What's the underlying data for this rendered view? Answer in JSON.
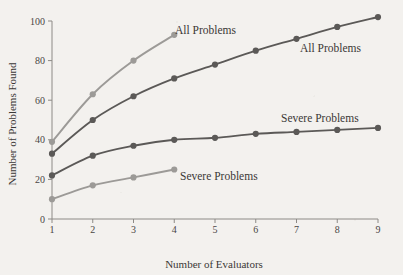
{
  "chart_data": {
    "type": "line",
    "title": "",
    "xlabel": "Number of Evaluators",
    "ylabel": "Number of Problems Found",
    "xlim": [
      1,
      9
    ],
    "ylim": [
      0,
      100
    ],
    "xticks": [
      "1",
      "2",
      "3",
      "4",
      "5",
      "6",
      "7",
      "8",
      "9"
    ],
    "yticks": [
      "0",
      "20",
      "40",
      "60",
      "80",
      "100"
    ],
    "grid": false,
    "legend_position": "inline-annotations",
    "x": [
      1,
      2,
      3,
      4,
      5,
      6,
      7,
      8,
      9
    ],
    "series": [
      {
        "name": "All Problems",
        "label": "All Problems",
        "color": "#9c9a97",
        "x": [
          1,
          2,
          3,
          4
        ],
        "values": [
          39,
          63,
          80,
          93
        ]
      },
      {
        "name": "All Problems",
        "label": "All Problems",
        "color": "#5b5957",
        "x": [
          1,
          2,
          3,
          4,
          5,
          6,
          7,
          8,
          9
        ],
        "values": [
          33,
          50,
          62,
          71,
          78,
          85,
          91,
          97,
          102
        ]
      },
      {
        "name": "Severe Problems",
        "label": "Severe Problems",
        "color": "#5b5957",
        "x": [
          1,
          2,
          3,
          4,
          5,
          6,
          7,
          8,
          9
        ],
        "values": [
          22,
          32,
          37,
          40,
          41,
          43,
          44,
          45,
          46
        ]
      },
      {
        "name": "Severe Problems",
        "label": "Severe Problems",
        "color": "#9c9a97",
        "x": [
          1,
          2,
          3,
          4
        ],
        "values": [
          10,
          17,
          21,
          25
        ]
      }
    ],
    "annotations": [
      {
        "text": "All Problems",
        "anchor_x": 4,
        "anchor_y": 93,
        "px": 175,
        "py": 34,
        "color": "#3b3836"
      },
      {
        "text": "All Problems",
        "anchor_x": 8,
        "anchor_y": 97,
        "px": 300,
        "py": 52,
        "color": "#3b3836"
      },
      {
        "text": "Severe Problems",
        "anchor_x": 8,
        "anchor_y": 45,
        "px": 281,
        "py": 122,
        "color": "#3b3836"
      },
      {
        "text": "Severe Problems",
        "anchor_x": 4,
        "anchor_y": 25,
        "px": 180,
        "py": 180,
        "color": "#3b3836"
      }
    ]
  },
  "figure": {
    "background": "#f3f1ee",
    "axis_color": "#8d8a86",
    "text_color": "#3b3836"
  }
}
